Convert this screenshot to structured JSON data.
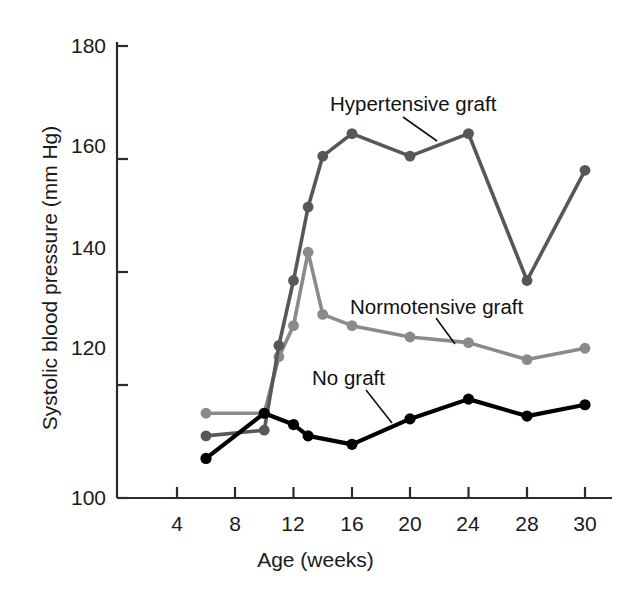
{
  "chart_data": {
    "type": "line",
    "title": "",
    "xlabel": "Age (weeks)",
    "ylabel": "Systolic blood pressure (mm Hg)",
    "xlim": [
      2,
      31
    ],
    "ylim": [
      100,
      180
    ],
    "xticks": [
      4,
      8,
      12,
      16,
      20,
      24,
      28,
      30
    ],
    "xtick_labels": [
      "4",
      "8",
      "12",
      "16",
      "20",
      "24",
      "28",
      "30"
    ],
    "yticks": [
      100,
      120,
      140,
      160,
      180
    ],
    "ytick_labels": [
      "100",
      "120",
      "140",
      "160",
      "180"
    ],
    "grid": false,
    "legend_position": "inline-annotations",
    "series": [
      {
        "name": "Hypertensive graft",
        "color": "#575757",
        "marker": "circle",
        "label_annotation": "Hypertensive graft",
        "x": [
          6,
          10,
          11,
          12,
          13,
          14,
          16,
          20,
          24,
          28,
          30
        ],
        "values": [
          111,
          112,
          127,
          138.5,
          151.5,
          160.5,
          164.5,
          160.5,
          164.5,
          138.5,
          158
        ]
      },
      {
        "name": "Normotensive graft",
        "color": "#8a8a8a",
        "marker": "circle",
        "label_annotation": "Normotensive graft",
        "x": [
          6,
          10,
          11,
          12,
          13,
          14,
          16,
          20,
          24,
          28,
          30
        ],
        "values": [
          115,
          115,
          125,
          130.5,
          143.5,
          132.5,
          130.5,
          128.5,
          127.5,
          124.5,
          126.5
        ]
      },
      {
        "name": "No graft",
        "color": "#000000",
        "marker": "circle",
        "label_annotation": "No graft",
        "x": [
          6,
          10,
          12,
          13,
          16,
          20,
          24,
          28,
          30
        ],
        "values": [
          107,
          115,
          113,
          111,
          109.5,
          114,
          117.5,
          114.5,
          116.5
        ]
      }
    ],
    "annotations": [
      {
        "text": "Hypertensive graft",
        "x_px": 330,
        "y_px": 92,
        "leader": [
          403,
          117,
          437,
          141
        ]
      },
      {
        "text": "Normotensive graft",
        "x_px": 350,
        "y_px": 295,
        "leader": [
          436,
          318,
          455,
          344
        ]
      },
      {
        "text": "No graft",
        "x_px": 312,
        "y_px": 366,
        "leader": [
          366,
          390,
          392,
          423
        ]
      }
    ]
  },
  "axis": {
    "y_title": "Systolic blood pressure (mm Hg)",
    "x_title": "Age (weeks)"
  }
}
